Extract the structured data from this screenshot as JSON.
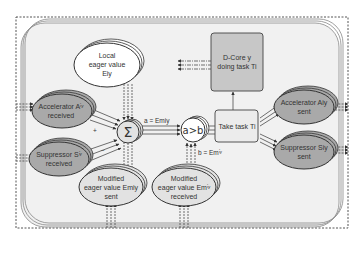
{
  "diagram": {
    "colors": {
      "background": "#ffffff",
      "panel_fill": "#f1f1f1",
      "panel_stroke": "#777777",
      "outer_dashed": "#555555",
      "dark_ellipse_fill": "#a9a9a9",
      "light_ellipse_fill": "#ffffff",
      "mid_ellipse_fill": "#e2e2e2",
      "box_fill": "#c7c7c7",
      "take_task_fill": "#ececec",
      "stroke": "#333333"
    },
    "nodes": {
      "local_eager": {
        "line1": "Local",
        "line2": "eager value",
        "line3": "Eiy"
      },
      "accelerator_received": {
        "line1": "Accelerator Aⁱʸ",
        "line2": "received"
      },
      "suppressor_received": {
        "line1": "Suppressor Sⁱʸ",
        "line2": "received"
      },
      "sum": {
        "symbol": "Σ"
      },
      "compare": {
        "symbol": "a>b"
      },
      "dcore": {
        "line1": "D-Core y",
        "line2": "doing task Ti"
      },
      "take_task": {
        "label": "Take task Ti"
      },
      "accelerator_sent": {
        "line1": "Accelerator Aiy",
        "line2": "sent"
      },
      "suppressor_sent": {
        "line1": "Suppressor Siy",
        "line2": "sent"
      },
      "modified_sent": {
        "line1": "Modified",
        "line2": "eager value Emiy",
        "line3": "sent"
      },
      "modified_received": {
        "line1": "Modified",
        "line2": "eager value Emⁱʸ",
        "line3": "received"
      }
    },
    "edges": {
      "a_label": "a = Emiy",
      "b_label": "b = Emⁱʸ",
      "plus_sign": "+",
      "minus_sign": "−"
    }
  }
}
